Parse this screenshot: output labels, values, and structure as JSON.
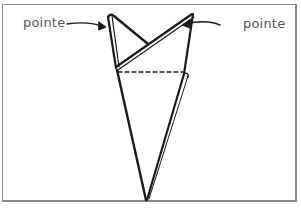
{
  "diagram": {
    "type": "folding-illustration",
    "labels": {
      "left": "pointe",
      "right": "pointe"
    },
    "elements": [
      {
        "kind": "folded-shape",
        "description": "inverted cone / pocket square with two points at top"
      },
      {
        "kind": "arrow",
        "from": "left label",
        "to": "left point"
      },
      {
        "kind": "arrow",
        "from": "right label",
        "to": "right point"
      },
      {
        "kind": "dashed-line",
        "description": "horizontal fold line across shape"
      }
    ],
    "colors": {
      "stroke": "#1a1a1a",
      "label": "#555555",
      "border": "#8a8a8a"
    }
  }
}
